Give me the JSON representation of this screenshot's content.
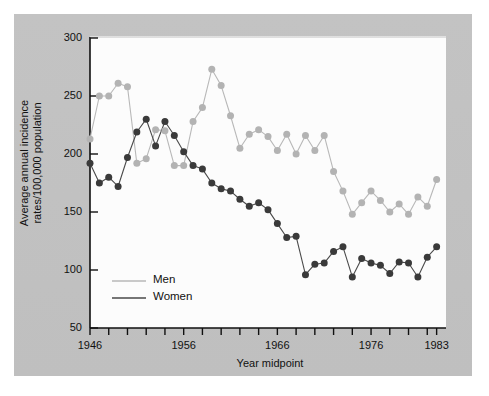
{
  "figure": {
    "background_color": "#c0c0c0",
    "plot_background_color": "#fcfcfc"
  },
  "chart_data": {
    "type": "line",
    "title": "",
    "xlabel": "Year midpoint",
    "ylabel": "Average annual incidence rates/100,000 population",
    "ylim": [
      50,
      300
    ],
    "xlim": [
      1946,
      1984
    ],
    "ytick_labels": [
      "50",
      "100",
      "150",
      "200",
      "250",
      "300"
    ],
    "ytick_values": [
      50,
      100,
      150,
      200,
      250,
      300
    ],
    "xtick_labels": [
      "1946",
      "1956",
      "1966",
      "1976",
      "1983"
    ],
    "xtick_values": [
      1946,
      1956,
      1966,
      1976,
      1983
    ],
    "xtick_minor_values": [
      1948,
      1950,
      1952,
      1954,
      1958,
      1960,
      1962,
      1964,
      1968,
      1970,
      1972,
      1974,
      1978,
      1980,
      1982
    ],
    "grid": false,
    "legend_position": "inside-lower-left",
    "markers": "filled-circle",
    "series": [
      {
        "name": "Men",
        "color": "#b3b3b3",
        "line_color": "#b8b8b8",
        "x": [
          1946,
          1947,
          1948,
          1949,
          1950,
          1951,
          1952,
          1953,
          1954,
          1955,
          1956,
          1957,
          1958,
          1959,
          1960,
          1961,
          1962,
          1963,
          1964,
          1965,
          1966,
          1967,
          1968,
          1969,
          1970,
          1971,
          1972,
          1973,
          1974,
          1975,
          1976,
          1977,
          1978,
          1979,
          1980,
          1981,
          1982,
          1983
        ],
        "values": [
          213,
          250,
          250,
          261,
          258,
          192,
          196,
          221,
          220,
          190,
          190,
          228,
          240,
          273,
          259,
          233,
          205,
          217,
          221,
          215,
          203,
          217,
          200,
          216,
          203,
          216,
          185,
          168,
          148,
          158,
          168,
          160,
          150,
          157,
          148,
          163,
          155,
          178
        ]
      },
      {
        "name": "Women",
        "color": "#3a3a3a",
        "line_color": "#4a4a4a",
        "x": [
          1946,
          1947,
          1948,
          1949,
          1950,
          1951,
          1952,
          1953,
          1954,
          1955,
          1956,
          1957,
          1958,
          1959,
          1960,
          1961,
          1962,
          1963,
          1964,
          1965,
          1966,
          1967,
          1968,
          1969,
          1970,
          1971,
          1972,
          1973,
          1974,
          1975,
          1976,
          1977,
          1978,
          1979,
          1980,
          1981,
          1982,
          1983
        ],
        "values": [
          192,
          175,
          180,
          172,
          197,
          219,
          230,
          207,
          228,
          216,
          202,
          190,
          187,
          175,
          170,
          168,
          161,
          155,
          158,
          152,
          140,
          128,
          129,
          96,
          105,
          106,
          116,
          120,
          94,
          110,
          106,
          104,
          97,
          107,
          106,
          94,
          111,
          120
        ]
      }
    ]
  },
  "legend": {
    "entries": [
      {
        "label": "Men"
      },
      {
        "label": "Women"
      }
    ]
  },
  "axes": {
    "y_title_line1": "Average annual incidence",
    "y_title_line2": "rates/100,000 population",
    "x_title": "Year midpoint"
  }
}
